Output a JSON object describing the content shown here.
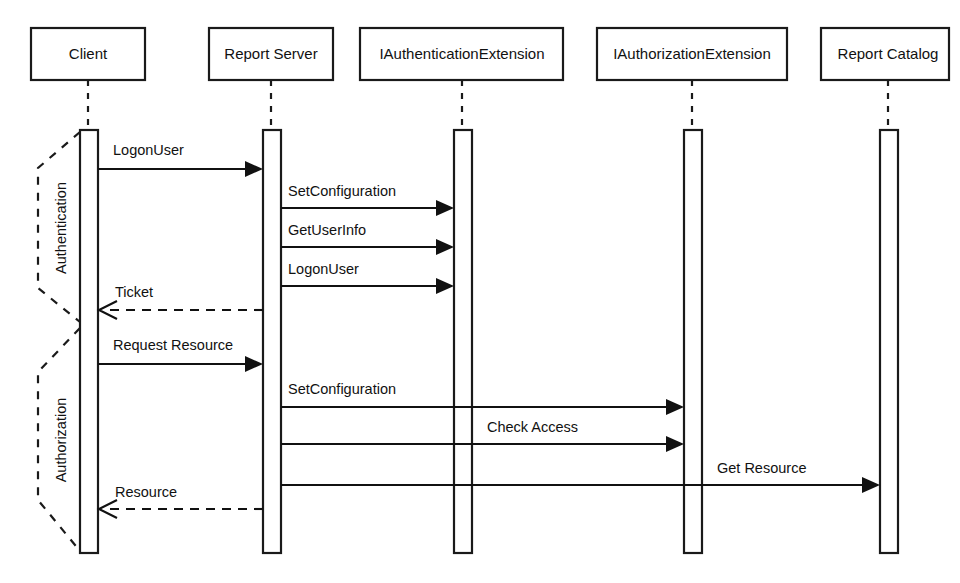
{
  "diagram": {
    "type": "uml-sequence-diagram",
    "background_color": "#ffffff",
    "line_color": "#1a1a1a"
  },
  "participants": [
    {
      "id": "client",
      "label": "Client",
      "box_x": 31,
      "box_y": 28,
      "box_w": 114,
      "box_h": 52,
      "center_x": 88,
      "bar_x": 80,
      "bar_w": 18,
      "bar_top": 130,
      "bar_bottom": 553
    },
    {
      "id": "reportsrv",
      "label": "Report Server",
      "box_x": 209,
      "box_y": 28,
      "box_w": 124,
      "box_h": 52,
      "center_x": 271,
      "bar_x": 263,
      "bar_w": 18,
      "bar_top": 130,
      "bar_bottom": 553
    },
    {
      "id": "authnext",
      "label": "IAuthenticationExtension",
      "box_x": 360,
      "box_y": 28,
      "box_w": 203,
      "box_h": 52,
      "center_x": 462,
      "bar_x": 454,
      "bar_w": 18,
      "bar_top": 130,
      "bar_bottom": 553
    },
    {
      "id": "authzext",
      "label": "IAuthorizationExtension",
      "box_x": 597,
      "box_y": 28,
      "box_w": 190,
      "box_h": 52,
      "center_x": 692,
      "bar_x": 684,
      "bar_w": 18,
      "bar_top": 130,
      "bar_bottom": 553
    },
    {
      "id": "catalog",
      "label": "Report Catalog",
      "box_x": 821,
      "box_y": 28,
      "box_w": 128,
      "box_h": 52,
      "center_x": 888,
      "bar_x": 880,
      "bar_w": 18,
      "bar_top": 130,
      "bar_bottom": 553
    }
  ],
  "messages": [
    {
      "id": "m1",
      "label": "LogonUser",
      "from": "client",
      "to": "reportsrv",
      "y": 169,
      "kind": "call",
      "label_x": 113,
      "label_y": 155
    },
    {
      "id": "m2",
      "label": "SetConfiguration",
      "from": "reportsrv",
      "to": "authnext",
      "y": 208,
      "kind": "call",
      "label_x": 288,
      "label_y": 196
    },
    {
      "id": "m3",
      "label": "GetUserInfo",
      "from": "reportsrv",
      "to": "authnext",
      "y": 247,
      "kind": "call",
      "label_x": 288,
      "label_y": 235
    },
    {
      "id": "m4",
      "label": "LogonUser",
      "from": "reportsrv",
      "to": "authnext",
      "y": 286,
      "kind": "call",
      "label_x": 288,
      "label_y": 274
    },
    {
      "id": "m5",
      "label": "Ticket",
      "from": "reportsrv",
      "to": "client",
      "y": 310,
      "kind": "return",
      "label_x": 115,
      "label_y": 297
    },
    {
      "id": "m6",
      "label": "Request Resource",
      "from": "client",
      "to": "reportsrv",
      "y": 364,
      "kind": "call",
      "label_x": 113,
      "label_y": 350
    },
    {
      "id": "m7",
      "label": "SetConfiguration",
      "from": "reportsrv",
      "to": "authzext",
      "y": 407,
      "kind": "call",
      "label_x": 288,
      "label_y": 394
    },
    {
      "id": "m8",
      "label": "Check Access",
      "from": "reportsrv",
      "to": "authzext",
      "y": 444,
      "kind": "call",
      "label_x": 487,
      "label_y": 432
    },
    {
      "id": "m9",
      "label": "Get Resource",
      "from": "reportsrv",
      "to": "catalog",
      "y": 485,
      "kind": "call",
      "label_x": 717,
      "label_y": 473
    },
    {
      "id": "m10",
      "label": "Resource",
      "from": "reportsrv",
      "to": "client",
      "y": 509,
      "kind": "return",
      "label_x": 115,
      "label_y": 497
    }
  ],
  "groups": [
    {
      "id": "authentication-group",
      "label": "Authentication",
      "label_x": 62,
      "label_y": 228,
      "apex_top_x": 80,
      "apex_top_y": 132,
      "mid_x": 38,
      "mid_top_y": 168,
      "mid_bottom_y": 288,
      "apex_bottom_x": 80,
      "apex_bottom_y": 322
    },
    {
      "id": "authorization-group",
      "label": "Authorization",
      "label_x": 62,
      "label_y": 440,
      "apex_top_x": 80,
      "apex_top_y": 328,
      "mid_x": 38,
      "mid_top_y": 372,
      "mid_bottom_y": 500,
      "apex_bottom_x": 80,
      "apex_bottom_y": 551
    }
  ]
}
